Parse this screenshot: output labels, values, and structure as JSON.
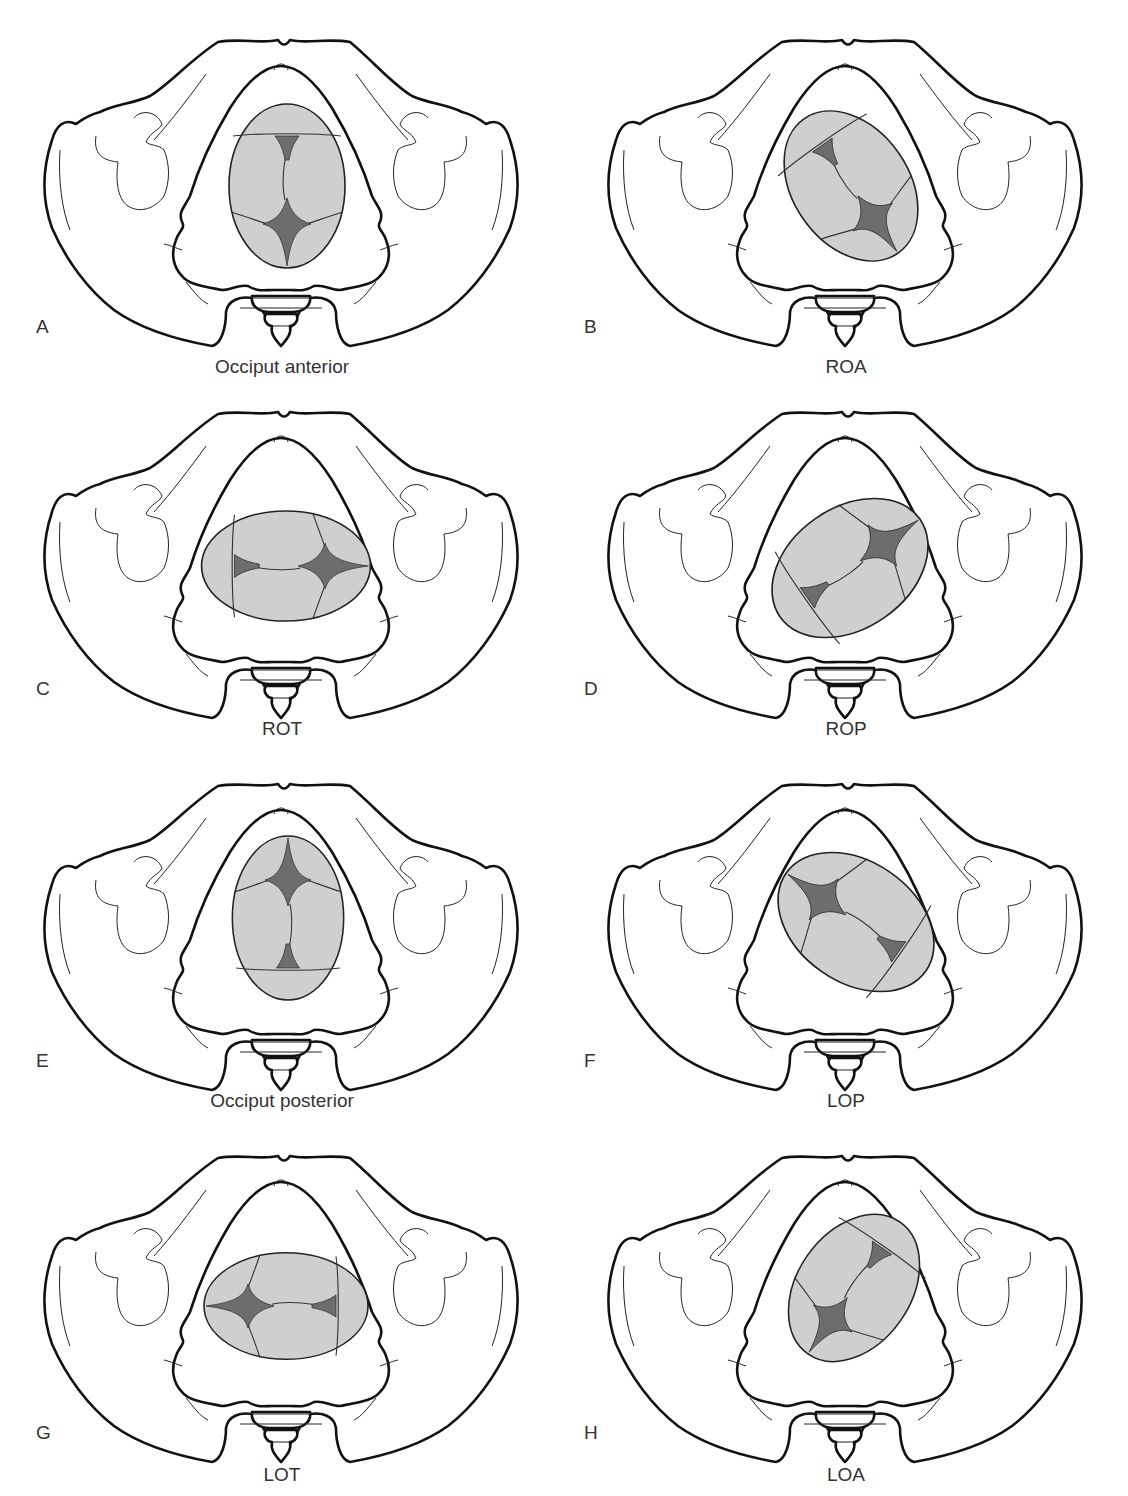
{
  "figure": {
    "colors": {
      "outline": "#111111",
      "head_fill": "#cfcfcf",
      "fontanelle_fill": "#6d6d6d",
      "background": "#ffffff"
    },
    "panels": [
      {
        "letter": "A",
        "caption": "Occiput anterior",
        "rotation": 0,
        "ellipse": {
          "rx": 58,
          "ry": 82
        }
      },
      {
        "letter": "B",
        "caption": "ROA",
        "rotation": -35,
        "ellipse": {
          "rx": 60,
          "ry": 84
        }
      },
      {
        "letter": "C",
        "caption": "ROT",
        "rotation": -90,
        "ellipse": {
          "rx": 62,
          "ry": 84
        }
      },
      {
        "letter": "D",
        "caption": "ROP",
        "rotation": -125,
        "ellipse": {
          "rx": 62,
          "ry": 86
        }
      },
      {
        "letter": "E",
        "caption": "Occiput posterior",
        "rotation": 180,
        "ellipse": {
          "rx": 56,
          "ry": 82
        }
      },
      {
        "letter": "F",
        "caption": "LOP",
        "rotation": 125,
        "ellipse": {
          "rx": 62,
          "ry": 86
        }
      },
      {
        "letter": "G",
        "caption": "LOT",
        "rotation": 90,
        "ellipse": {
          "rx": 60,
          "ry": 80
        }
      },
      {
        "letter": "H",
        "caption": "LOA",
        "rotation": 35,
        "ellipse": {
          "rx": 58,
          "ry": 82
        }
      }
    ]
  }
}
